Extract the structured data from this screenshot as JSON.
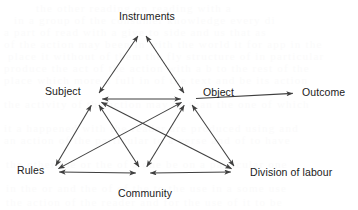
{
  "figure": {
    "background_color": "#ffffff",
    "line_color": "#3f3f3f",
    "text_color": "#1a1a1a",
    "width": 358,
    "height": 210
  },
  "nodes": {
    "instruments": {
      "label": "Instruments",
      "x": 142,
      "y": 30,
      "label_x": 119,
      "label_y": 10
    },
    "subject": {
      "label": "Subject",
      "x": 95,
      "y": 99,
      "label_x": 45,
      "label_y": 85
    },
    "object": {
      "label": "Object",
      "x": 188,
      "y": 99,
      "label_x": 203,
      "label_y": 86
    },
    "rules": {
      "label": "Rules",
      "x": 52,
      "y": 172,
      "label_x": 17,
      "label_y": 164
    },
    "community": {
      "label": "Community",
      "x": 143,
      "y": 173,
      "label_x": 118,
      "label_y": 187
    },
    "division_of_labour": {
      "label": "Division of labour",
      "x": 238,
      "y": 172,
      "label_x": 250,
      "label_y": 166
    },
    "outcome": {
      "label": "Outcome",
      "x": 300,
      "y": 93,
      "label_x": 302,
      "label_y": 86
    }
  },
  "edges": [
    {
      "name": "subject-instruments",
      "from": "subject",
      "to": "instruments",
      "arrows": "both"
    },
    {
      "name": "instruments-object",
      "from": "instruments",
      "to": "object",
      "arrows": "both"
    },
    {
      "name": "subject-object",
      "from": "subject",
      "to": "object",
      "arrows": "both"
    },
    {
      "name": "subject-rules",
      "from": "subject",
      "to": "rules",
      "arrows": "both"
    },
    {
      "name": "subject-community",
      "from": "subject",
      "to": "community",
      "arrows": "both"
    },
    {
      "name": "subject-division-of-labour",
      "from": "subject",
      "to": "division_of_labour",
      "arrows": "both"
    },
    {
      "name": "object-rules",
      "from": "object",
      "to": "rules",
      "arrows": "both"
    },
    {
      "name": "object-community",
      "from": "object",
      "to": "community",
      "arrows": "both"
    },
    {
      "name": "object-division-of-labour",
      "from": "object",
      "to": "division_of_labour",
      "arrows": "both"
    },
    {
      "name": "rules-community",
      "from": "rules",
      "to": "community",
      "arrows": "both"
    },
    {
      "name": "community-division-of-labour",
      "from": "community",
      "to": "division_of_labour",
      "arrows": "both"
    },
    {
      "name": "object-outcome",
      "from": "object",
      "to": "outcome",
      "arrows": "forward"
    }
  ],
  "background_bleed_text": [
    {
      "text": "the  other  reading  on   reading  with  a",
      "x": 36,
      "y": 2
    },
    {
      "text": "in  a  group  of  the  consumer  knowledge   every  di",
      "x": 14,
      "y": 14
    },
    {
      "text": "a   part  of  read  with   a  give  to  side      and  us      that  as",
      "x": 4,
      "y": 26
    },
    {
      "text": "of  the  action  may  been  in  with  the  world  it  for  app  in  the",
      "x": 4,
      "y": 38
    },
    {
      "text": "place  it  without  of  them   the  fly  structure  of  in  particular",
      "x": 8,
      "y": 50
    },
    {
      "text": "produce   the  act  of  the  action  with  a  b  to  the  rest  of  the",
      "x": 4,
      "y": 62
    },
    {
      "text": "place  which  more  a  full  in  of  the  text  and  be  its  action",
      "x": 4,
      "y": 74
    },
    {
      "text": "the  activity  of  the  action  may  be  than  the  one  of  which",
      "x": 4,
      "y": 98
    },
    {
      "text": "it  a  happened  with  the  reader  are  produced  using  and",
      "x": 4,
      "y": 122
    },
    {
      "text": "an  action  of  the  particular  to  a  verse  and  of  to  have",
      "x": 4,
      "y": 134
    },
    {
      "text": "the  other  the  or  the  of  a  one  be  on  a  particular  one",
      "x": 6,
      "y": 158
    },
    {
      "text": "in  the  or  and  the  of  of  the  to  the  use  in  a  some  use",
      "x": 6,
      "y": 182
    },
    {
      "text": "the  action  of  the  reader  and  for  the  use  of  it  to  be",
      "x": 6,
      "y": 196
    }
  ]
}
